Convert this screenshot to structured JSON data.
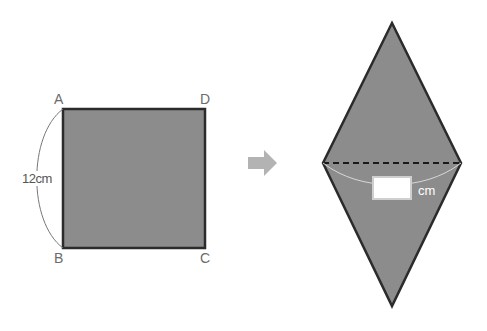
{
  "square": {
    "vertices": {
      "A": "A",
      "B": "B",
      "C": "C",
      "D": "D"
    },
    "side_length_label": "12cm",
    "fill": "#8c8c8c",
    "stroke": "#2b2b2b"
  },
  "arrow": {
    "icon": "right-arrow-icon",
    "color": "#b3b3b3"
  },
  "rhombus": {
    "fill": "#8c8c8c",
    "stroke": "#2b2b2b",
    "diagonal_style": "dashed",
    "answer_box": "",
    "unit_label": "cm"
  }
}
